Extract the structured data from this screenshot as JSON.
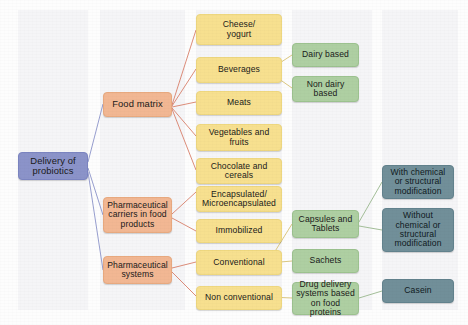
{
  "diagram": {
    "title": "Delivery of probiotics",
    "type": "hierarchy-flowchart",
    "colors": {
      "root": "#8b93c9",
      "level2": "#f2b793",
      "level3": "#f7e08f",
      "level4": "#aecfa2",
      "level5": "#718f99",
      "connector_warm": "#d9806b",
      "connector_yellow": "#d8c274",
      "connector_green": "#9ab88d",
      "connector_blue": "#8b93c9",
      "panel": "#f1f2f4",
      "background": "#fdfdfd"
    },
    "nodes": {
      "root": {
        "label": "Delivery of\nprobiotics"
      },
      "level2": [
        {
          "id": "food-matrix",
          "label": "Food matrix"
        },
        {
          "id": "pharma-carriers",
          "label": "Pharmaceutical\ncarriers in food\nproducts"
        },
        {
          "id": "pharma-systems",
          "label": "Pharmaceutical\nsystems"
        }
      ],
      "level3": [
        {
          "id": "cheese-yogurt",
          "label": "Cheese/\nyogurt"
        },
        {
          "id": "beverages",
          "label": "Beverages"
        },
        {
          "id": "meats",
          "label": "Meats"
        },
        {
          "id": "vegetables-fruits",
          "label": "Vegetables and\nfruits"
        },
        {
          "id": "chocolate-cereals",
          "label": "Chocolate and\ncereals"
        },
        {
          "id": "encapsulated",
          "label": "Encapsulated/\nMicroencapsulated"
        },
        {
          "id": "immobilized",
          "label": "Immobilized"
        },
        {
          "id": "conventional",
          "label": "Conventional"
        },
        {
          "id": "non-conventional",
          "label": "Non conventional"
        }
      ],
      "level4": [
        {
          "id": "dairy-based",
          "label": "Dairy based"
        },
        {
          "id": "non-dairy-based",
          "label": "Non dairy\nbased"
        },
        {
          "id": "capsules-tablets",
          "label": "Capsules and\nTablets"
        },
        {
          "id": "sachets",
          "label": "Sachets"
        },
        {
          "id": "drug-delivery-food-proteins",
          "label": "Drug delivery\nsystems based\non food proteins"
        }
      ],
      "level5": [
        {
          "id": "with-modification",
          "label": "With chemical\nor structural\nmodification"
        },
        {
          "id": "without-modification",
          "label": "Without\nchemical or\nstructural\nmodification"
        },
        {
          "id": "casein",
          "label": "Casein"
        }
      ]
    },
    "edges": [
      {
        "from": "root",
        "to": "food-matrix"
      },
      {
        "from": "root",
        "to": "pharma-carriers"
      },
      {
        "from": "root",
        "to": "pharma-systems"
      },
      {
        "from": "food-matrix",
        "to": "cheese-yogurt"
      },
      {
        "from": "food-matrix",
        "to": "beverages"
      },
      {
        "from": "food-matrix",
        "to": "meats"
      },
      {
        "from": "food-matrix",
        "to": "vegetables-fruits"
      },
      {
        "from": "food-matrix",
        "to": "chocolate-cereals"
      },
      {
        "from": "pharma-carriers",
        "to": "encapsulated"
      },
      {
        "from": "pharma-carriers",
        "to": "immobilized"
      },
      {
        "from": "pharma-systems",
        "to": "conventional"
      },
      {
        "from": "pharma-systems",
        "to": "non-conventional"
      },
      {
        "from": "beverages",
        "to": "dairy-based"
      },
      {
        "from": "beverages",
        "to": "non-dairy-based"
      },
      {
        "from": "conventional",
        "to": "capsules-tablets"
      },
      {
        "from": "conventional",
        "to": "sachets"
      },
      {
        "from": "non-conventional",
        "to": "drug-delivery-food-proteins"
      },
      {
        "from": "capsules-tablets",
        "to": "with-modification"
      },
      {
        "from": "capsules-tablets",
        "to": "without-modification"
      },
      {
        "from": "drug-delivery-food-proteins",
        "to": "casein"
      }
    ]
  }
}
